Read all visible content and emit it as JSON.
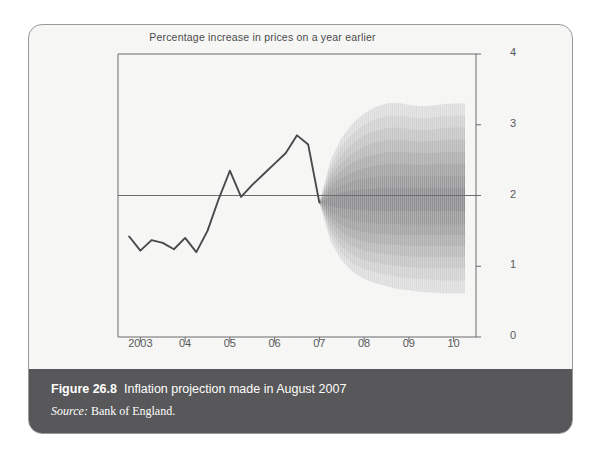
{
  "figure": {
    "chart_title": "Percentage increase in prices on a year earlier",
    "caption_number": "Figure 26.8",
    "caption_title": "Inflation projection made in August 2007",
    "source_label": "Source:",
    "source_value": "Bank of England."
  },
  "colors": {
    "card_background": "#f7f7f6",
    "card_border": "#9a9a9a",
    "caption_band": "#58585a",
    "caption_text": "#ffffff",
    "axis": "#6b6b6c",
    "history_line": "#4a4a4c",
    "fan_darkest": "#8e8e90",
    "fan_lightest": "#e2e2e2"
  },
  "chart_data": {
    "type": "area",
    "title": "Percentage increase in prices on a year earlier",
    "xlabel": "",
    "ylabel": "",
    "ylim": [
      0,
      4
    ],
    "yticks": [
      0,
      1,
      2,
      3,
      4
    ],
    "ytick_labels": [
      "0",
      "1",
      "2",
      "3",
      "4"
    ],
    "xlim": [
      2002.5,
      2010.5
    ],
    "xticks": [
      2003,
      2004,
      2005,
      2006,
      2007,
      2008,
      2009,
      2010
    ],
    "xtick_labels": [
      "2003",
      "04",
      "05",
      "06",
      "07",
      "08",
      "09",
      "10"
    ],
    "grid": false,
    "legend": null,
    "reference_line": {
      "y": 2,
      "label": ""
    },
    "forecast_start": 2007.0,
    "series": [
      {
        "name": "CPI inflation (history)",
        "type": "line",
        "x": [
          2002.75,
          2003.0,
          2003.25,
          2003.5,
          2003.75,
          2004.0,
          2004.25,
          2004.5,
          2004.75,
          2005.0,
          2005.25,
          2005.5,
          2005.75,
          2006.0,
          2006.25,
          2006.5,
          2006.75,
          2007.0
        ],
        "values": [
          1.42,
          1.22,
          1.37,
          1.33,
          1.24,
          1.4,
          1.2,
          1.5,
          1.95,
          2.35,
          1.98,
          2.15,
          2.3,
          2.45,
          2.6,
          2.85,
          2.72,
          1.9
        ]
      },
      {
        "name": "Projection central (mode)",
        "type": "line",
        "x": [
          2007.0,
          2007.25,
          2007.5,
          2007.75,
          2008.0,
          2008.25,
          2008.5,
          2008.75,
          2009.0,
          2009.25,
          2009.5,
          2009.75,
          2010.0,
          2010.25
        ],
        "values": [
          1.9,
          1.92,
          1.96,
          2.0,
          2.02,
          2.03,
          2.02,
          2.0,
          1.99,
          1.98,
          1.98,
          1.99,
          2.0,
          2.0
        ]
      }
    ],
    "fan_bands": [
      {
        "name": "90% interval",
        "shade": "#dededf",
        "lower": [
          1.9,
          1.35,
          1.08,
          0.92,
          0.82,
          0.76,
          0.72,
          0.68,
          0.66,
          0.64,
          0.63,
          0.62,
          0.62,
          0.62
        ],
        "upper": [
          1.9,
          2.5,
          2.82,
          3.02,
          3.16,
          3.25,
          3.3,
          3.31,
          3.28,
          3.26,
          3.27,
          3.29,
          3.3,
          3.3
        ]
      },
      {
        "name": "80% interval",
        "shade": "#d2d2d3",
        "lower": [
          1.9,
          1.42,
          1.18,
          1.04,
          0.96,
          0.91,
          0.88,
          0.85,
          0.83,
          0.82,
          0.81,
          0.8,
          0.8,
          0.8
        ],
        "upper": [
          1.9,
          2.42,
          2.7,
          2.88,
          3.0,
          3.08,
          3.12,
          3.13,
          3.11,
          3.09,
          3.1,
          3.12,
          3.13,
          3.13
        ]
      },
      {
        "name": "70% interval",
        "shade": "#c6c6c7",
        "lower": [
          1.9,
          1.49,
          1.28,
          1.16,
          1.09,
          1.05,
          1.02,
          1.0,
          0.99,
          0.98,
          0.97,
          0.97,
          0.97,
          0.97
        ],
        "upper": [
          1.9,
          2.35,
          2.58,
          2.74,
          2.85,
          2.91,
          2.95,
          2.96,
          2.94,
          2.92,
          2.93,
          2.95,
          2.96,
          2.96
        ]
      },
      {
        "name": "60% interval",
        "shade": "#bababb",
        "lower": [
          1.9,
          1.56,
          1.38,
          1.28,
          1.22,
          1.19,
          1.17,
          1.15,
          1.14,
          1.13,
          1.13,
          1.13,
          1.13,
          1.13
        ],
        "upper": [
          1.9,
          2.28,
          2.47,
          2.6,
          2.69,
          2.75,
          2.78,
          2.79,
          2.77,
          2.76,
          2.77,
          2.78,
          2.79,
          2.79
        ]
      },
      {
        "name": "50% interval",
        "shade": "#aeaeaf",
        "lower": [
          1.9,
          1.63,
          1.48,
          1.4,
          1.35,
          1.32,
          1.31,
          1.3,
          1.29,
          1.29,
          1.29,
          1.29,
          1.29,
          1.29
        ],
        "upper": [
          1.9,
          2.21,
          2.36,
          2.47,
          2.54,
          2.58,
          2.61,
          2.62,
          2.61,
          2.6,
          2.6,
          2.61,
          2.62,
          2.62
        ]
      },
      {
        "name": "40% interval",
        "shade": "#a3a3a4",
        "lower": [
          1.9,
          1.7,
          1.58,
          1.52,
          1.48,
          1.46,
          1.45,
          1.44,
          1.44,
          1.44,
          1.44,
          1.44,
          1.44,
          1.44
        ],
        "upper": [
          1.9,
          2.14,
          2.25,
          2.33,
          2.39,
          2.42,
          2.44,
          2.45,
          2.44,
          2.43,
          2.44,
          2.45,
          2.45,
          2.45
        ]
      },
      {
        "name": "30% interval",
        "shade": "#999a9b",
        "lower": [
          1.9,
          1.77,
          1.69,
          1.64,
          1.62,
          1.6,
          1.6,
          1.59,
          1.59,
          1.59,
          1.59,
          1.59,
          1.59,
          1.59
        ],
        "upper": [
          1.9,
          2.07,
          2.14,
          2.2,
          2.24,
          2.26,
          2.28,
          2.28,
          2.28,
          2.27,
          2.28,
          2.28,
          2.28,
          2.28
        ]
      },
      {
        "name": "10% central interval",
        "shade": "#8e8e90",
        "lower": [
          1.9,
          1.85,
          1.82,
          1.8,
          1.79,
          1.78,
          1.78,
          1.78,
          1.78,
          1.78,
          1.78,
          1.78,
          1.78,
          1.78
        ],
        "upper": [
          1.9,
          1.99,
          2.04,
          2.07,
          2.09,
          2.1,
          2.11,
          2.11,
          2.11,
          2.1,
          2.11,
          2.11,
          2.11,
          2.11
        ]
      }
    ]
  }
}
